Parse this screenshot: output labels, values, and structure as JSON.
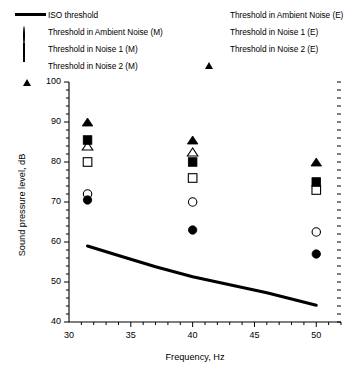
{
  "chart_data": {
    "type": "scatter",
    "title": "",
    "xlabel": "Frequency, Hz",
    "ylabel": "Sound pressure level, dB",
    "xlim": [
      30,
      52
    ],
    "ylim": [
      40,
      100
    ],
    "x_ticks": [
      30,
      35,
      40,
      45,
      50
    ],
    "y_ticks": [
      40,
      50,
      60,
      70,
      80,
      90,
      100
    ],
    "x_minor_step": 1,
    "y_minor_step": 2,
    "grid": false,
    "legend_position": "above-plot",
    "x": [
      31.5,
      40,
      50
    ],
    "series": [
      {
        "name": "ISO threshold",
        "marker": "line",
        "filled": true,
        "type": "line",
        "x": [
          31.5,
          34,
          37,
          40,
          43,
          46,
          50
        ],
        "values": [
          59.0,
          56.6,
          53.8,
          51.3,
          49.3,
          47.3,
          44.2
        ]
      },
      {
        "name": "Threshold in Ambient Noise (M)",
        "marker": "circle",
        "filled": false,
        "values": [
          72.0,
          70.0,
          62.5
        ]
      },
      {
        "name": "Threshold in Noise 1 (M)",
        "marker": "square",
        "filled": false,
        "values": [
          80.0,
          76.0,
          73.0
        ]
      },
      {
        "name": "Threshold in Noise 2 (M)",
        "marker": "triangle",
        "filled": false,
        "values": [
          84.0,
          82.5,
          null
        ]
      },
      {
        "name": "Threshold in Ambient Noise (E)",
        "marker": "circle",
        "filled": true,
        "values": [
          70.5,
          63.0,
          57.0
        ]
      },
      {
        "name": "Threshold in Noise 1 (E)",
        "marker": "square",
        "filled": true,
        "values": [
          85.5,
          80.0,
          75.0
        ]
      },
      {
        "name": "Threshold in Noise 2 (E)",
        "marker": "triangle",
        "filled": true,
        "values": [
          90.0,
          85.5,
          80.0
        ]
      }
    ]
  },
  "legend": {
    "left_items": [
      {
        "label": "ISO threshold",
        "key": "line-key"
      },
      {
        "label": "Threshold in Ambient Noise (M)",
        "key": "circle-open-key"
      },
      {
        "label": "Threshold in Noise 1 (M)",
        "key": "square-open-key"
      },
      {
        "label": "Threshold in Noise 2 (M)",
        "key": "triangle-open-key"
      }
    ],
    "right_items": [
      {
        "label": "Threshold in Ambient Noise (E)",
        "key": "circle-filled-key"
      },
      {
        "label": "Threshold in Noise 1 (E)",
        "key": "square-filled-key"
      },
      {
        "label": "Threshold in Noise 2 (E)",
        "key": "triangle-filled-key"
      }
    ]
  },
  "axes": {
    "x_tick_labels": [
      "30",
      "35",
      "40",
      "45",
      "50"
    ],
    "y_tick_labels": [
      "40",
      "50",
      "60",
      "70",
      "80",
      "90",
      "100"
    ],
    "x_title": "Frequency, Hz",
    "y_title": "Sound pressure level, dB"
  },
  "colors": {
    "ink": "#000000",
    "background": "#ffffff"
  }
}
